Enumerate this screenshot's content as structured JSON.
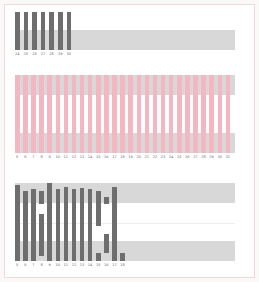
{
  "chart_data": [
    {
      "type": "bar",
      "title": "",
      "panel": "top",
      "categories": [
        "24",
        "25",
        "26",
        "27",
        "28",
        "29",
        "30"
      ],
      "values": [
        1,
        1,
        1,
        1,
        1,
        1,
        1
      ],
      "bar_color": "#6e6e6e",
      "band_color": "#d8d8d8",
      "xlabel": "",
      "ylabel": "",
      "grid": false
    },
    {
      "type": "bar",
      "title": "",
      "panel": "middle",
      "categories": [
        "5",
        "6",
        "7",
        "8",
        "9",
        "10",
        "11",
        "12",
        "13",
        "14",
        "15",
        "16",
        "17",
        "18",
        "19",
        "20",
        "21",
        "22",
        "23",
        "24",
        "25",
        "26",
        "27",
        "28",
        "29",
        "30",
        "31"
      ],
      "values": [
        1,
        1,
        1,
        1,
        1,
        1,
        1,
        1,
        1,
        1,
        1,
        1,
        1,
        1,
        1,
        1,
        1,
        1,
        1,
        1,
        1,
        1,
        1,
        1,
        1,
        1,
        1
      ],
      "bar_color": "#f4b6c0",
      "band_color": "#d8d8d8",
      "xlabel": "",
      "ylabel": "",
      "grid": false
    },
    {
      "type": "bar",
      "title": "",
      "panel": "bottom",
      "categories": [
        "5",
        "6",
        "7",
        "8",
        "9",
        "10",
        "11",
        "12",
        "13",
        "14",
        "15",
        "16",
        "17",
        "18"
      ],
      "segments": [
        [
          [
            0,
            0.97
          ]
        ],
        [
          [
            0,
            0.9
          ]
        ],
        [
          [
            0,
            0.92
          ]
        ],
        [
          [
            0.07,
            0.6
          ],
          [
            0.73,
            0.9
          ]
        ],
        [
          [
            0,
            1.0
          ]
        ],
        [
          [
            0,
            0.92
          ]
        ],
        [
          [
            0,
            0.95
          ]
        ],
        [
          [
            0,
            0.92
          ]
        ],
        [
          [
            0,
            0.93
          ]
        ],
        [
          [
            0,
            0.92
          ]
        ],
        [
          [
            0,
            0.1
          ],
          [
            0.45,
            0.9
          ]
        ],
        [
          [
            0.1,
            0.35
          ],
          [
            0.73,
            0.82
          ]
        ],
        [
          [
            0,
            0.95
          ]
        ],
        [
          [
            0,
            0.1
          ]
        ]
      ],
      "bar_color": "#6e6e6e",
      "band_color": "#d8d8d8",
      "xlabel": "",
      "ylabel": "",
      "grid": true
    }
  ],
  "colors": {
    "frame_border": "#f0d8dc",
    "dark_bar": "#6e6e6e",
    "pink_bar": "#f4b6c0",
    "band": "#d8d8d8"
  }
}
